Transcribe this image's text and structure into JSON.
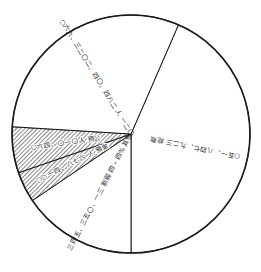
{
  "chart_data": {
    "type": "pie",
    "title": "",
    "center": [
      131,
      134
    ],
    "radius": 119,
    "start_angle_deg": 23.5,
    "direction": "clockwise",
    "label_orientation": "rotated (printed upside-down along radial lines)",
    "categories": [
      "○五一、八四七、九二三 総数",
      "三四五、三五〇、一三 割弱 四・四% 其他",
      "○○ 一四、八七六 人 預金",
      "○六四、〇一〇人 預公",
      "○六六、三二〇二、四〇、四八二 人 一二〇"
    ],
    "slices": [
      {
        "label": "○五一、八四七、九二三 総数",
        "angle_deg": 156.5,
        "percent": 43.5,
        "fill": "white"
      },
      {
        "label": "三四五、三五〇、一三 割弱 四・四% 其他",
        "angle_deg": 56,
        "percent": 15.5,
        "fill": "white"
      },
      {
        "label": "○○ 一四、八七六 人 預金",
        "angle_deg": 15,
        "percent": 4.2,
        "fill": "hatched"
      },
      {
        "label": "○六四、〇一〇人 預公",
        "angle_deg": 22.5,
        "percent": 6.3,
        "fill": "hatched"
      },
      {
        "label": "○六六、三二〇二、四〇、四八二 人 一二〇",
        "angle_deg": 110,
        "percent": 30.5,
        "fill": "white"
      }
    ],
    "values": [
      43.5,
      15.5,
      4.2,
      6.3,
      30.5
    ],
    "legend": "none",
    "grid": false,
    "colors": {
      "stroke": "#1a1a1a",
      "fill": "#ffffff",
      "hatch": "#555555"
    }
  }
}
